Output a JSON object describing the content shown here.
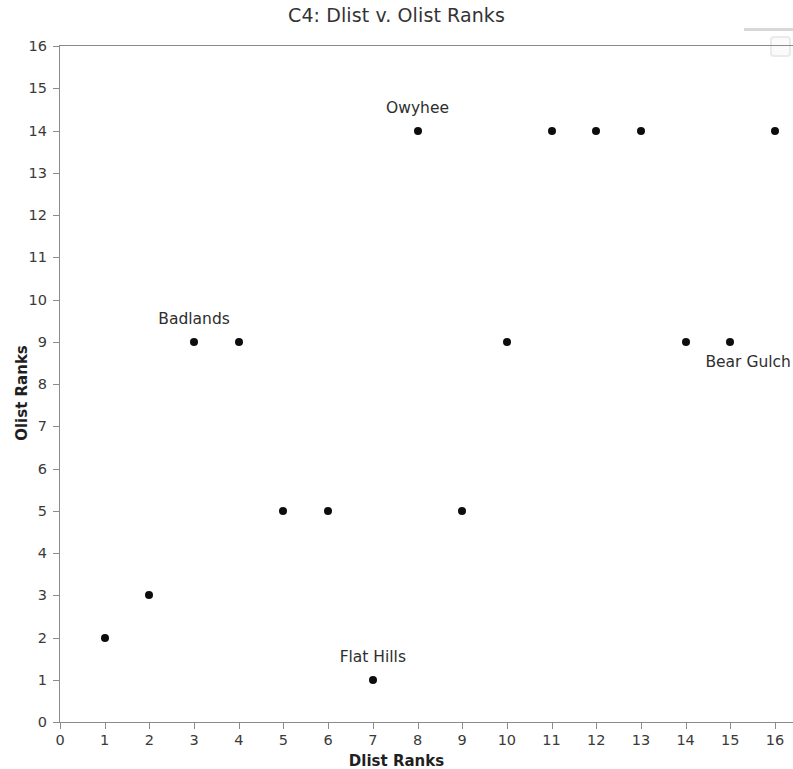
{
  "chart_data": {
    "type": "scatter",
    "title": "C4: Dlist v. Olist Ranks",
    "xlabel": "Dlist Ranks",
    "ylabel": "Olist Ranks",
    "xlim": [
      0,
      16
    ],
    "ylim": [
      0,
      16
    ],
    "xticks": [
      0,
      1,
      2,
      3,
      4,
      5,
      6,
      7,
      8,
      9,
      10,
      11,
      12,
      13,
      14,
      15,
      16
    ],
    "yticks": [
      0,
      1,
      2,
      3,
      4,
      5,
      6,
      7,
      8,
      9,
      10,
      11,
      12,
      13,
      14,
      15,
      16
    ],
    "grid": false,
    "legend": "none",
    "marker": "circle",
    "marker_color": "#0d0d0d",
    "x": [
      1,
      2,
      3,
      4,
      5,
      6,
      7,
      8,
      9,
      10,
      11,
      12,
      13,
      14,
      15,
      16
    ],
    "y": [
      2,
      3,
      9,
      9,
      5,
      5,
      1,
      14,
      5,
      9,
      14,
      14,
      14,
      9,
      9,
      14
    ],
    "points": [
      {
        "x": 1,
        "y": 2
      },
      {
        "x": 2,
        "y": 3
      },
      {
        "x": 3,
        "y": 9
      },
      {
        "x": 4,
        "y": 9
      },
      {
        "x": 5,
        "y": 5
      },
      {
        "x": 6,
        "y": 5
      },
      {
        "x": 7,
        "y": 1
      },
      {
        "x": 8,
        "y": 14
      },
      {
        "x": 9,
        "y": 5
      },
      {
        "x": 10,
        "y": 9
      },
      {
        "x": 11,
        "y": 14
      },
      {
        "x": 12,
        "y": 14
      },
      {
        "x": 13,
        "y": 14
      },
      {
        "x": 14,
        "y": 9
      },
      {
        "x": 15,
        "y": 9
      },
      {
        "x": 16,
        "y": 14
      }
    ],
    "annotations": [
      {
        "text": "Owyhee",
        "x": 8,
        "y": 14,
        "position": "above"
      },
      {
        "text": "Badlands",
        "x": 3,
        "y": 9,
        "position": "above"
      },
      {
        "text": "Bear Gulch",
        "x": 15.4,
        "y": 9,
        "position": "below"
      },
      {
        "text": "Flat Hills",
        "x": 7,
        "y": 1,
        "position": "above"
      }
    ]
  }
}
